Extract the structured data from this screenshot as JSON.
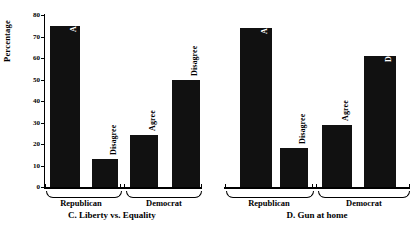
{
  "chart_data": [
    {
      "type": "bar",
      "title": "C. Liberty vs. Equality",
      "panel_id": "C",
      "xlabel": "",
      "ylabel": "Percentage",
      "ylim": [
        0,
        80
      ],
      "yticks": [
        0,
        10,
        20,
        30,
        40,
        50,
        60,
        70,
        80
      ],
      "ytick_labels": [
        "0",
        "10",
        "20",
        "30",
        "40",
        "50",
        "60",
        "70",
        "80"
      ],
      "grid": false,
      "legend": "none",
      "axis_visible": true,
      "groups": [
        "Republican",
        "Democrat"
      ],
      "categories": [
        "Agree",
        "Disagree",
        "Agree",
        "Disagree"
      ],
      "values": [
        75,
        13,
        24,
        50
      ],
      "bars": [
        {
          "group": "Republican",
          "response": "Agree",
          "value": 75,
          "label_placement": "inside"
        },
        {
          "group": "Republican",
          "response": "Disagree",
          "value": 13,
          "label_placement": "outside"
        },
        {
          "group": "Democrat",
          "response": "Agree",
          "value": 24,
          "label_placement": "outside"
        },
        {
          "group": "Democrat",
          "response": "Disagree",
          "value": 50,
          "label_placement": "outside"
        }
      ],
      "bar_color": "#111111"
    },
    {
      "type": "bar",
      "title": "D. Gun at home",
      "panel_id": "D",
      "xlabel": "",
      "ylabel": "",
      "ylim": [
        0,
        80
      ],
      "yticks": [
        0,
        10,
        20,
        30,
        40,
        50,
        60,
        70,
        80
      ],
      "ytick_labels": [],
      "grid": false,
      "legend": "none",
      "axis_visible": false,
      "groups": [
        "Republican",
        "Democrat"
      ],
      "categories": [
        "Agree",
        "Disagree",
        "Agree",
        "Disagree"
      ],
      "values": [
        74,
        18,
        29,
        61
      ],
      "bars": [
        {
          "group": "Republican",
          "response": "Agree",
          "value": 74,
          "label_placement": "inside"
        },
        {
          "group": "Republican",
          "response": "Disagree",
          "value": 18,
          "label_placement": "outside"
        },
        {
          "group": "Democrat",
          "response": "Agree",
          "value": 29,
          "label_placement": "outside"
        },
        {
          "group": "Democrat",
          "response": "Disagree",
          "value": 61,
          "label_placement": "inside"
        }
      ],
      "bar_color": "#111111"
    }
  ],
  "figure": {
    "background": "#ffffff",
    "foreground": "#000000",
    "panel_left": {
      "axis_title": "Percentage",
      "ticks": [
        "80",
        "70",
        "60",
        "50",
        "40",
        "30",
        "20",
        "10",
        "0"
      ],
      "bar_labels": [
        "Agree",
        "Disagree",
        "Agree",
        "Disagree"
      ],
      "group_labels": [
        "Republican",
        "Democrat"
      ],
      "caption": "C. Liberty vs. Equality"
    },
    "panel_right": {
      "bar_labels": [
        "Agree",
        "Disagree",
        "Agree",
        "Disagree"
      ],
      "group_labels": [
        "Republican",
        "Democrat"
      ],
      "caption": "D. Gun at home"
    }
  }
}
